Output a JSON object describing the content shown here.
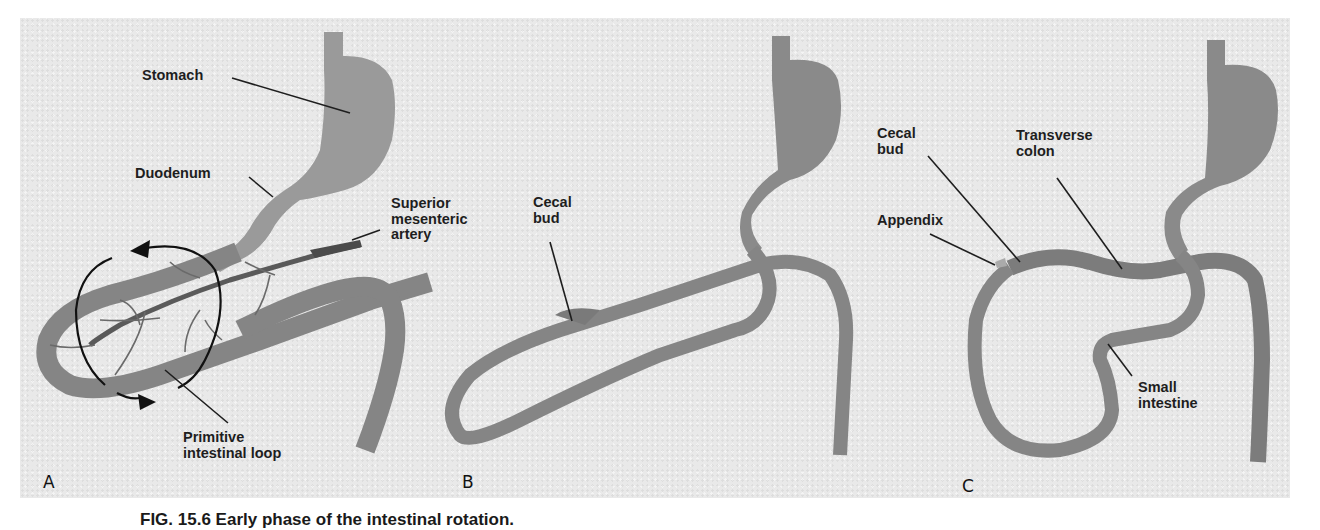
{
  "figure": {
    "caption": "FIG. 15.6  Early phase of the intestinal rotation.",
    "colors": {
      "background": "#e9e9e9",
      "gut": "#8c8c8c",
      "gut_dark": "#6f6f6f",
      "artery": "#555555",
      "leader_line": "#1e1e1e"
    },
    "panels": [
      {
        "letter": "A",
        "labels": {
          "stomach": "Stomach",
          "duodenum": "Duodenum",
          "superior_mesenteric_artery": "Superior\nmesenteric\nartery",
          "primitive_intestinal_loop": "Primitive\nintestinal loop"
        },
        "icons": [
          "rotation-arrow-counterclockwise-icon"
        ]
      },
      {
        "letter": "B",
        "labels": {
          "cecal_bud": "Cecal\nbud"
        }
      },
      {
        "letter": "C",
        "labels": {
          "cecal_bud": "Cecal\nbud",
          "appendix": "Appendix",
          "transverse_colon": "Transverse\ncolon",
          "small_intestine": "Small\nintestine"
        }
      }
    ]
  }
}
